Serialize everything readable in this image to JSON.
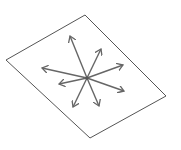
{
  "diagram": {
    "colors": {
      "plane_stroke": "#555555",
      "arrow_stroke": "#666666",
      "background": "#ffffff"
    },
    "plane": {
      "points": [
        [
          6,
          60
        ],
        [
          85,
          15
        ],
        [
          166,
          96
        ],
        [
          90,
          138
        ]
      ]
    },
    "center": [
      87,
      78
    ],
    "arrows": [
      {
        "to": [
          70,
          36
        ]
      },
      {
        "to": [
          101,
          49
        ]
      },
      {
        "to": [
          42,
          68
        ]
      },
      {
        "to": [
          123,
          65
        ]
      },
      {
        "to": [
          59,
          84
        ]
      },
      {
        "to": [
          124,
          91
        ]
      },
      {
        "to": [
          73,
          107
        ]
      },
      {
        "to": [
          99,
          106
        ]
      }
    ]
  }
}
